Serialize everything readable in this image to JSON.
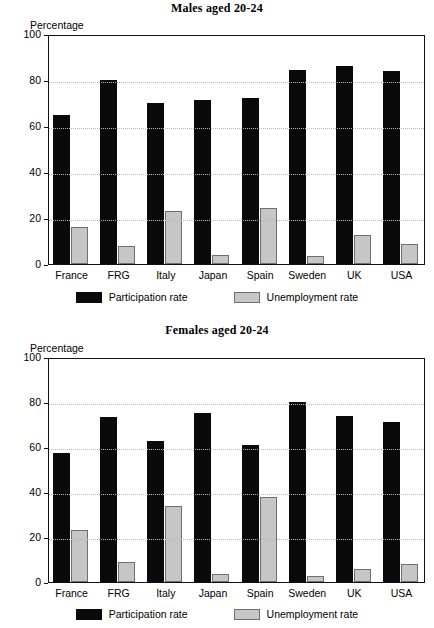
{
  "page": {
    "background": "#ffffff",
    "series_colors": {
      "participation": "#0a0a0a",
      "unemployment": "#c6c6c6",
      "unemployment_border": "#6f6f6f",
      "axis": "#111111",
      "gridline": "#b8b8b8"
    }
  },
  "charts": [
    {
      "id": "males",
      "title": "Males aged 20-24",
      "axis_unit_label": "Percentage",
      "ytick_labels": [
        "100",
        "80",
        "60",
        "40",
        "20",
        "0"
      ],
      "categories": [
        "France",
        "FRG",
        "Italy",
        "Japan",
        "Spain",
        "Sweden",
        "UK",
        "USA"
      ],
      "legend": [
        {
          "label": "Participation rate",
          "swatch": "participation"
        },
        {
          "label": "Unemployment rate",
          "swatch": "unemployment"
        }
      ]
    },
    {
      "id": "females",
      "title": "Females aged 20-24",
      "axis_unit_label": "Percentage",
      "ytick_labels": [
        "100",
        "80",
        "60",
        "40",
        "20",
        "0"
      ],
      "categories": [
        "France",
        "FRG",
        "Italy",
        "Japan",
        "Spain",
        "Sweden",
        "UK",
        "USA"
      ],
      "legend": [
        {
          "label": "Participation rate",
          "swatch": "participation"
        },
        {
          "label": "Unemployment rate",
          "swatch": "unemployment"
        }
      ]
    }
  ],
  "chart_data": [
    {
      "type": "bar",
      "id": "males",
      "title": "Males aged 20-24",
      "xlabel": "",
      "ylabel": "Percentage",
      "ylim": [
        0,
        100
      ],
      "yticks": [
        0,
        20,
        40,
        60,
        80,
        100
      ],
      "grid": true,
      "legend_position": "bottom",
      "categories": [
        "France",
        "FRG",
        "Italy",
        "Japan",
        "Spain",
        "Sweden",
        "UK",
        "USA"
      ],
      "series": [
        {
          "name": "Participation rate",
          "color": "#0a0a0a",
          "values": [
            65,
            80,
            70,
            71.5,
            72,
            84.5,
            86,
            84
          ]
        },
        {
          "name": "Unemployment rate",
          "color": "#c6c6c6",
          "values": [
            16,
            8,
            23,
            4,
            24.5,
            3.5,
            12.5,
            8.5
          ]
        }
      ]
    },
    {
      "type": "bar",
      "id": "females",
      "title": "Females aged 20-24",
      "xlabel": "",
      "ylabel": "Percentage",
      "ylim": [
        0,
        100
      ],
      "yticks": [
        0,
        20,
        40,
        60,
        80,
        100
      ],
      "grid": true,
      "legend_position": "bottom",
      "categories": [
        "France",
        "FRG",
        "Italy",
        "Japan",
        "Spain",
        "Sweden",
        "UK",
        "USA"
      ],
      "series": [
        {
          "name": "Participation rate",
          "color": "#0a0a0a",
          "values": [
            57.5,
            73.5,
            62.5,
            75,
            61,
            80,
            74,
            71
          ]
        },
        {
          "name": "Unemployment rate",
          "color": "#c6c6c6",
          "values": [
            23,
            9,
            34,
            3.5,
            38,
            2.5,
            6,
            8
          ]
        }
      ]
    }
  ]
}
